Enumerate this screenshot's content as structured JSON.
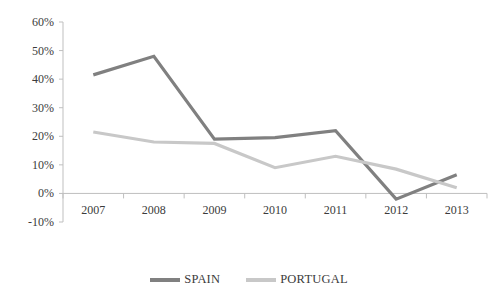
{
  "chart_data": {
    "type": "line",
    "title": "",
    "xlabel": "",
    "ylabel": "",
    "categories": [
      "2007",
      "2008",
      "2009",
      "2010",
      "2011",
      "2012",
      "2013"
    ],
    "series": [
      {
        "name": "SPAIN",
        "color": "#808080",
        "values": [
          41.5,
          48.0,
          19.0,
          19.5,
          22.0,
          -2.0,
          6.5
        ]
      },
      {
        "name": "PORTUGAL",
        "color": "#c8c8c8",
        "values": [
          21.5,
          18.0,
          17.5,
          9.0,
          13.0,
          8.5,
          2.0
        ]
      }
    ],
    "ylim": [
      -10,
      60
    ],
    "ytick_values": [
      60,
      50,
      40,
      30,
      20,
      10,
      0,
      -10
    ],
    "ytick_labels": [
      "60%",
      "50%",
      "40%",
      "30%",
      "20%",
      "10%",
      "0%",
      "-10%"
    ],
    "grid": false,
    "legend_position": "bottom",
    "axis_color": "#bfbfbf",
    "text_color": "#3b3b3b"
  },
  "legend": {
    "entries": [
      {
        "label": "SPAIN"
      },
      {
        "label": "PORTUGAL"
      }
    ]
  }
}
